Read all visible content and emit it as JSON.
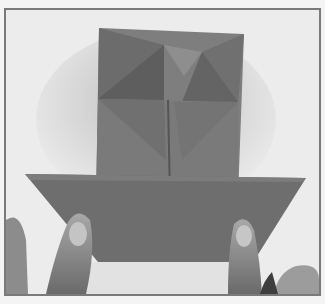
{
  "image": {
    "description": "Photograph of hands folding a sheet of origami paper; upper square section shows triangular fold creases, lower wide trapezoid flap held by two thumbs",
    "colors": {
      "background": "#ececec",
      "frame_border": "#7a7a7a",
      "paper_light": "#8a8a8a",
      "paper_mid": "#767676",
      "paper_dark": "#5e5e5e",
      "skin": "#9a9a9a",
      "skin_dark": "#555555"
    }
  }
}
